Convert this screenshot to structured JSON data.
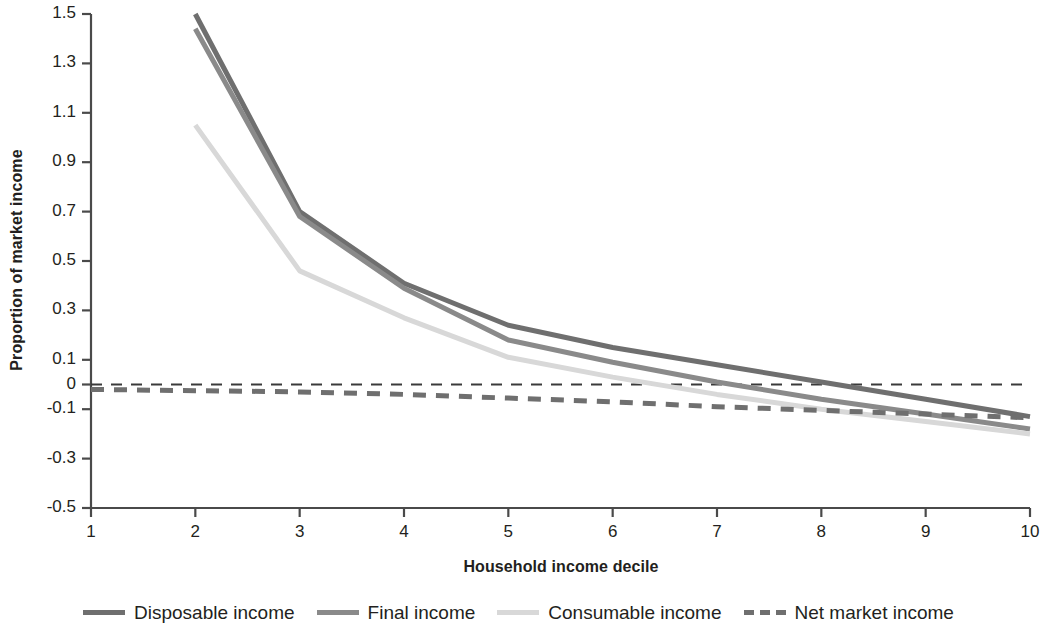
{
  "chart_data": {
    "type": "line",
    "title": "",
    "xlabel": "Household income decile",
    "ylabel": "Proportion of market income",
    "xlim": [
      1,
      10
    ],
    "ylim": [
      -0.5,
      1.5
    ],
    "grid": false,
    "legend_position": "bottom",
    "x": [
      1,
      2,
      3,
      4,
      5,
      6,
      7,
      8,
      9,
      10
    ],
    "xticks": [
      "1",
      "2",
      "3",
      "4",
      "5",
      "6",
      "7",
      "8",
      "9",
      "10"
    ],
    "yticks": [
      "1.5",
      "1.3",
      "1.1",
      "0.9",
      "0.7",
      "0.5",
      "0.3",
      "0.1",
      "0",
      "-0.1",
      "-0.3",
      "-0.5"
    ],
    "ytick_values": [
      1.5,
      1.3,
      1.1,
      0.9,
      0.7,
      0.5,
      0.3,
      0.1,
      0,
      -0.1,
      -0.3,
      -0.5
    ],
    "zero_reference_line": 0,
    "series": [
      {
        "name": "Disposable income",
        "color": "#6f6f6f",
        "style": "solid",
        "width": 5,
        "values": [
          null,
          1.5,
          0.7,
          0.41,
          0.24,
          0.15,
          0.08,
          0.01,
          -0.06,
          -0.13
        ]
      },
      {
        "name": "Final income",
        "color": "#8a8a8a",
        "style": "solid",
        "width": 5,
        "values": [
          null,
          1.44,
          0.68,
          0.39,
          0.18,
          0.09,
          0.01,
          -0.06,
          -0.12,
          -0.18
        ]
      },
      {
        "name": "Consumable income",
        "color": "#d8d8d8",
        "style": "solid",
        "width": 5,
        "values": [
          null,
          1.05,
          0.46,
          0.27,
          0.11,
          0.03,
          -0.04,
          -0.1,
          -0.15,
          -0.2
        ]
      },
      {
        "name": "Net market income",
        "color": "#6f6f6f",
        "style": "dashed",
        "width": 5,
        "values": [
          -0.02,
          -0.025,
          -0.03,
          -0.04,
          -0.055,
          -0.07,
          -0.09,
          -0.105,
          -0.12,
          -0.135
        ]
      }
    ]
  },
  "legend": {
    "items": [
      {
        "label": "Disposable income"
      },
      {
        "label": "Final income"
      },
      {
        "label": "Consumable income"
      },
      {
        "label": "Net market income"
      }
    ]
  }
}
